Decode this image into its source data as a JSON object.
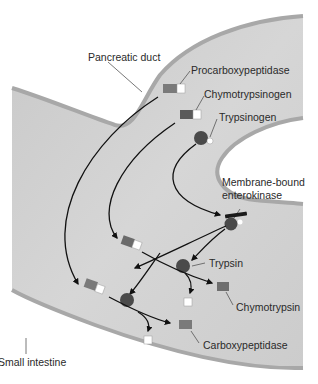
{
  "diagram": {
    "colors": {
      "background": "#ffffff",
      "lumen": "#cfcfcf",
      "wall": "#a8a8a8",
      "enzyme_dark": "#5a5a5a",
      "enzyme_block": "#7a7a7a",
      "peptide_white": "#ffffff",
      "arrow": "#111111",
      "label": "#2a2a2a"
    },
    "labels": {
      "pancreatic_duct": "Pancreatic duct",
      "procarboxypeptidase": "Procarboxypeptidase",
      "chymotrypsinogen": "Chymotrypsinogen",
      "trypsinogen": "Trypsinogen",
      "membrane_bound_line1": "Membrane-bound",
      "membrane_bound_line2": "enterokinase",
      "trypsin": "Trypsin",
      "chymotrypsin": "Chymotrypsin",
      "carboxypeptidase": "Carboxypeptidase",
      "small_intestine": "Small intestine"
    },
    "structures": [
      {
        "name": "Pancreatic duct",
        "type": "duct"
      },
      {
        "name": "Small intestine",
        "type": "lumen"
      },
      {
        "name": "Membrane-bound enterokinase",
        "type": "membrane enzyme"
      }
    ],
    "zymogens": [
      {
        "name": "Procarboxypeptidase",
        "shape": "gray block + white square"
      },
      {
        "name": "Chymotrypsinogen",
        "shape": "dark block + white square"
      },
      {
        "name": "Trypsinogen",
        "shape": "dark circle + small white circle"
      }
    ],
    "active_enzymes": [
      {
        "name": "Trypsin",
        "shape": "dark circle"
      },
      {
        "name": "Chymotrypsin",
        "shape": "gray block"
      },
      {
        "name": "Carboxypeptidase",
        "shape": "gray block"
      }
    ],
    "flows": [
      {
        "from": "Trypsinogen",
        "via": "Membrane-bound enterokinase",
        "to": "Trypsin"
      },
      {
        "from": "Chymotrypsinogen",
        "via": "Trypsin",
        "to": "Chymotrypsin"
      },
      {
        "from": "Procarboxypeptidase",
        "via": "Trypsin",
        "to": "Carboxypeptidase"
      }
    ]
  }
}
